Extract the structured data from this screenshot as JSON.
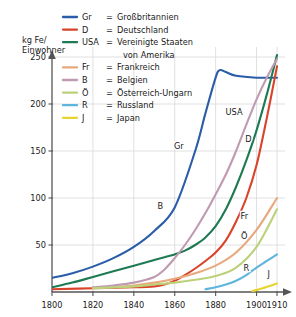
{
  "chart_data": {
    "type": "line",
    "title": "",
    "ylabel": "kg Fe/ Einwohner",
    "ylabel_line1": "kg Fe/",
    "ylabel_line2": "Einwohner",
    "xlabel": "",
    "xlim": [
      1800,
      1910
    ],
    "ylim": [
      0,
      250
    ],
    "grid": true,
    "yticks": [
      50,
      100,
      150,
      200,
      250
    ],
    "ytick_labels": [
      "50",
      "100",
      "150",
      "200",
      "250"
    ],
    "xticks": [
      1800,
      1820,
      1840,
      1860,
      1880,
      1900,
      1910
    ],
    "xtick_labels": [
      "1800",
      "1820",
      "1840",
      "1860",
      "1880",
      "1900",
      "1910"
    ],
    "legend_position": "top-center",
    "legend_title": "",
    "series": [
      {
        "code": "Gr",
        "name": "Großbritannien",
        "color": "#2a5ca8",
        "inline_label": "Gr",
        "inline_label_x": 1862,
        "inline_label_y": 152,
        "x": [
          1800,
          1810,
          1820,
          1830,
          1840,
          1850,
          1860,
          1870,
          1875,
          1880,
          1882,
          1885,
          1890,
          1900,
          1910
        ],
        "values": [
          15,
          20,
          27,
          36,
          48,
          65,
          90,
          150,
          190,
          228,
          236,
          234,
          230,
          228,
          228
        ]
      },
      {
        "code": "D",
        "name": "Deutschland",
        "color": "#d9432a",
        "inline_label": "D",
        "inline_label_x": 1896,
        "inline_label_y": 160,
        "x": [
          1800,
          1820,
          1840,
          1850,
          1855,
          1860,
          1865,
          1870,
          1875,
          1880,
          1885,
          1890,
          1895,
          1900,
          1905,
          1910
        ],
        "values": [
          3,
          4,
          5,
          6,
          8,
          12,
          18,
          25,
          33,
          42,
          55,
          75,
          100,
          135,
          185,
          240
        ]
      },
      {
        "code": "USA",
        "name": "Vereinigte Staaten von Amerika",
        "name_line1": "Vereinigte Staaten",
        "name_line2": "von Amerika",
        "color": "#1e7a52",
        "inline_label": "USA",
        "inline_label_x": 1889,
        "inline_label_y": 188,
        "x": [
          1800,
          1810,
          1820,
          1830,
          1840,
          1850,
          1855,
          1860,
          1865,
          1870,
          1875,
          1880,
          1885,
          1890,
          1895,
          1900,
          1905,
          1910
        ],
        "values": [
          5,
          10,
          16,
          22,
          28,
          34,
          37,
          40,
          44,
          50,
          58,
          70,
          88,
          112,
          140,
          172,
          210,
          252
        ]
      },
      {
        "code": "Fr",
        "name": "Frankreich",
        "color": "#e8a87c",
        "inline_label": "Fr",
        "inline_label_x": 1894,
        "inline_label_y": 78,
        "x": [
          1820,
          1830,
          1840,
          1850,
          1860,
          1870,
          1880,
          1890,
          1900,
          1910
        ],
        "values": [
          4,
          5,
          7,
          10,
          14,
          20,
          28,
          42,
          66,
          100
        ]
      },
      {
        "code": "B",
        "name": "Belgien",
        "color": "#c09ab0",
        "inline_label": "B",
        "inline_label_x": 1853,
        "inline_label_y": 88,
        "x": [
          1820,
          1830,
          1840,
          1850,
          1855,
          1860,
          1865,
          1870,
          1875,
          1880,
          1885,
          1890,
          1895,
          1900,
          1905,
          1910
        ],
        "values": [
          5,
          7,
          10,
          16,
          24,
          36,
          50,
          66,
          84,
          104,
          125,
          150,
          178,
          205,
          228,
          248
        ]
      },
      {
        "code": "Ö",
        "name": "Österreich-Ungarn",
        "color": "#bcd17a",
        "inline_label": "Ö",
        "inline_label_x": 1894,
        "inline_label_y": 56,
        "x": [
          1820,
          1840,
          1850,
          1860,
          1870,
          1880,
          1890,
          1900,
          1910
        ],
        "values": [
          4,
          6,
          8,
          10,
          13,
          17,
          26,
          48,
          88
        ]
      },
      {
        "code": "R",
        "name": "Russland",
        "color": "#5fb4dd",
        "inline_label": "R",
        "inline_label_x": 1895,
        "inline_label_y": 22,
        "x": [
          1875,
          1880,
          1885,
          1890,
          1895,
          1900,
          1905,
          1910
        ],
        "values": [
          3,
          5,
          8,
          12,
          18,
          26,
          33,
          40
        ]
      },
      {
        "code": "J",
        "name": "Japan",
        "color": "#e8d430",
        "inline_label": "J",
        "inline_label_x": 1906,
        "inline_label_y": 16,
        "x": [
          1898,
          1900,
          1903,
          1906,
          1910
        ],
        "values": [
          1,
          2,
          4,
          6,
          9
        ]
      }
    ],
    "legend_equals": "="
  }
}
